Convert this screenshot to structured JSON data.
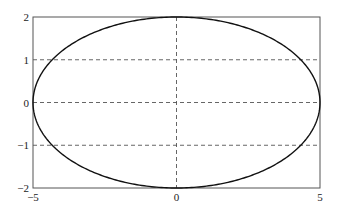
{
  "chart_data": {
    "type": "line",
    "title": "",
    "xlabel": "",
    "ylabel": "",
    "xlim": [
      -5,
      5
    ],
    "ylim": [
      -2,
      2
    ],
    "grid": "dashed lines at x=0 and y=-1,0,1",
    "legend": "none",
    "x_ticks": [
      {
        "value": -5,
        "label": "-5"
      },
      {
        "value": 0,
        "label": "0"
      },
      {
        "value": 5,
        "label": "5"
      }
    ],
    "y_ticks": [
      {
        "value": -2,
        "label": "-2"
      },
      {
        "value": -1,
        "label": "-1"
      },
      {
        "value": 0,
        "label": "0"
      },
      {
        "value": 1,
        "label": "1"
      },
      {
        "value": 2,
        "label": "2"
      }
    ],
    "grid_lines": {
      "vertical": [
        0
      ],
      "horizontal": [
        -1,
        0,
        1
      ]
    },
    "series": [
      {
        "name": "ellipse",
        "description": "ellipse x^2/25 + y^2/4 = 1",
        "semi_axis_x": 5,
        "semi_axis_y": 2,
        "center": [
          0,
          0
        ],
        "color": "#111111"
      }
    ]
  }
}
